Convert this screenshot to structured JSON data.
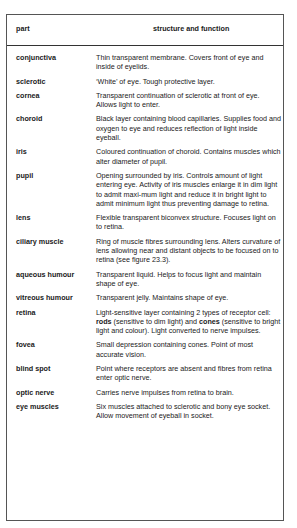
{
  "table": {
    "headers": {
      "part": "part",
      "structure": "structure and function"
    },
    "rows": [
      {
        "part": "conjunctiva",
        "desc": "Thin transparent membrane. Covers front of eye and inside of eyelids."
      },
      {
        "part": "sclerotic",
        "desc": "‘White’ of eye. Tough protective layer."
      },
      {
        "part": "cornea",
        "desc": "Transparent continuation of sclerotic at front of eye. Allows light to enter."
      },
      {
        "part": "choroid",
        "desc": "Black layer containing blood capillaries. Supplies food and oxygen to eye and reduces reflection of light inside eyeball."
      },
      {
        "part": "iris",
        "desc": "Coloured continuation of choroid. Contains muscles which alter diameter of pupil."
      },
      {
        "part": "pupil",
        "desc": "Opening surrounded by iris. Controls amount of light entering eye. Activity of iris muscles enlarge it in dim light to admit maxi-mum light and reduce it in bright light to admit minimum light thus preventing damage to retina."
      },
      {
        "part": "lens",
        "desc": "Flexible transparent biconvex structure. Focuses light on to retina."
      },
      {
        "part": "ciliary muscle",
        "desc": "Ring of muscle fibres surrounding lens. Alters curvature of lens allowing near and distant objects to be focused on to retina (see figure 23.3)."
      },
      {
        "part": "aqueous humour",
        "desc": "Transparent liquid. Helps to focus light and maintain shape of eye."
      },
      {
        "part": "vitreous humour",
        "desc": "Transparent jelly. Maintains shape of eye."
      },
      {
        "part": "retina",
        "desc_parts": [
          "Light-sensitive layer containing 2 types of receptor cell: ",
          "rods",
          " (sensitive to dim light) and ",
          "cones",
          " (sensitive to bright light and colour). Light converted to nerve impulses."
        ]
      },
      {
        "part": "fovea",
        "desc": "Small depression containing cones. Point of most accurate vision."
      },
      {
        "part": "blind spot",
        "desc": "Point where receptors are absent and fibres from retina enter optic nerve."
      },
      {
        "part": "optic nerve",
        "desc": "Carries nerve impulses from retina to brain."
      },
      {
        "part": "eye muscles",
        "desc": "Six muscles attached to sclerotic and bony eye socket. Allow movement of eyeball in socket."
      }
    ]
  }
}
